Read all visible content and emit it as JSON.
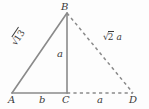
{
  "figure": {
    "background_color": "#fdfdfd",
    "stroke_color": "#8a8a8a",
    "text_color": "#3a3a3a",
    "width": 149,
    "height": 109
  },
  "vertices": [
    {
      "id": "A",
      "label": "A",
      "x": 12,
      "y": 93
    },
    {
      "id": "B",
      "label": "B",
      "x": 67,
      "y": 13
    },
    {
      "id": "C",
      "label": "C",
      "x": 67,
      "y": 93
    },
    {
      "id": "D",
      "label": "D",
      "x": 133,
      "y": 93
    }
  ],
  "edges": [
    {
      "id": "AB",
      "from": "A",
      "to": "B",
      "style": "solid"
    },
    {
      "id": "AC",
      "from": "A",
      "to": "C",
      "style": "solid"
    },
    {
      "id": "BC",
      "from": "B",
      "to": "C",
      "style": "solid"
    },
    {
      "id": "BD",
      "from": "B",
      "to": "D",
      "style": "dashed"
    },
    {
      "id": "CD",
      "from": "C",
      "to": "D",
      "style": "dashed"
    }
  ],
  "side_labels": {
    "ab_radical_symbol": "√",
    "ab_radicand": "13",
    "ac": "b",
    "bc": "a",
    "cd": "a",
    "bd_radical_symbol": "√",
    "bd_radicand": "2",
    "bd_coefficient": "a"
  }
}
